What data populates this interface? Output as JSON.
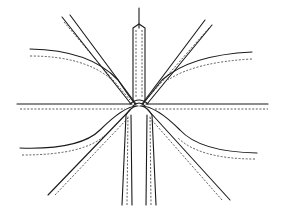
{
  "figure": {
    "center": [
      138,
      105
    ],
    "stroke_color": "#1a1a1a",
    "background": "#ffffff"
  }
}
